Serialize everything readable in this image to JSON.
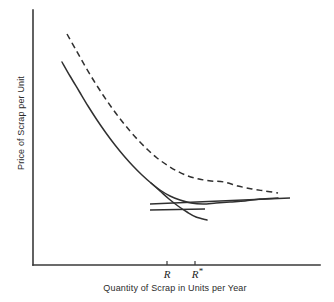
{
  "chart_data": {
    "type": "line",
    "title": "",
    "xlabel": "Quantity of Scrap in Units per Year",
    "ylabel": "Price of Scrap per Unit",
    "grid": false,
    "legend": "none",
    "xlim": [
      0,
      100
    ],
    "ylim": [
      0,
      100
    ],
    "axis_ticks_numeric": false,
    "xticks": [
      {
        "label": "R",
        "star": "",
        "x_px": 167
      },
      {
        "label": "R",
        "star": "*",
        "x_px": 195
      }
    ],
    "yticks": [],
    "series": [
      {
        "name": "solid-average-cost-curve",
        "style": "solid",
        "points_px": [
          [
            62,
            62
          ],
          [
            70,
            76
          ],
          [
            79,
            91
          ],
          [
            88,
            106
          ],
          [
            97,
            120
          ],
          [
            106,
            133
          ],
          [
            115,
            145
          ],
          [
            124,
            156
          ],
          [
            133,
            166
          ],
          [
            142,
            175
          ],
          [
            151,
            183
          ],
          [
            160,
            190
          ],
          [
            170,
            196
          ],
          [
            180,
            200
          ],
          [
            191,
            203
          ],
          [
            203,
            204
          ],
          [
            216,
            203
          ],
          [
            230,
            202
          ],
          [
            245,
            201
          ],
          [
            260,
            199
          ],
          [
            278,
            198
          ]
        ]
      },
      {
        "name": "solid-lower-branch",
        "style": "solid",
        "points_px": [
          [
            151,
            183
          ],
          [
            160,
            191
          ],
          [
            169,
            199
          ],
          [
            178,
            206
          ],
          [
            187,
            212
          ],
          [
            196,
            217
          ],
          [
            207,
            220
          ]
        ]
      },
      {
        "name": "dashed-average-cost-curve",
        "style": "dashed",
        "points_px": [
          [
            67,
            34
          ],
          [
            76,
            50
          ],
          [
            85,
            66
          ],
          [
            94,
            81
          ],
          [
            103,
            95
          ],
          [
            112,
            108
          ],
          [
            121,
            120
          ],
          [
            130,
            131
          ],
          [
            139,
            141
          ],
          [
            148,
            150
          ],
          [
            157,
            158
          ],
          [
            167,
            165
          ],
          [
            177,
            171
          ],
          [
            188,
            176
          ],
          [
            199,
            179
          ],
          [
            211,
            181
          ],
          [
            224,
            182
          ],
          [
            238,
            186
          ],
          [
            252,
            189
          ],
          [
            265,
            191
          ],
          [
            278,
            193
          ]
        ]
      }
    ],
    "tangent_lines_px": [
      {
        "name": "upper-tangent",
        "x1": 150,
        "y1": 204,
        "x2": 290,
        "y2": 198
      },
      {
        "name": "lower-tangent",
        "x1": 150,
        "y1": 210,
        "x2": 205,
        "y2": 209
      }
    ],
    "axes_px": {
      "y_axis": {
        "x": 33,
        "y_top": 10,
        "y_bottom": 265
      },
      "x_axis": {
        "y": 265,
        "x_left": 33,
        "x_right": 320
      }
    }
  },
  "labels": {
    "y_axis": "Price of Scrap per Unit",
    "x_axis": "Quantity of Scrap in Units per Year",
    "tick_r": "R",
    "tick_r_star": "R",
    "star_glyph": "*"
  },
  "colors": {
    "axis": "#3a3a3a",
    "curve": "#303030",
    "text": "#2b2b2b",
    "background": "#ffffff"
  }
}
